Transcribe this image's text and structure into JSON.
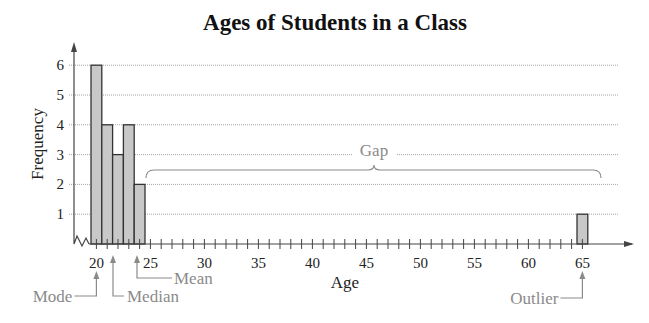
{
  "chart_data": {
    "type": "bar",
    "subtype": "histogram",
    "title": "Ages of Students in a Class",
    "xlabel": "Age",
    "ylabel": "Frequency",
    "categories": [
      20,
      21,
      22,
      23,
      24,
      65
    ],
    "values": [
      6,
      4,
      3,
      4,
      2,
      1
    ],
    "xlim": [
      19,
      66
    ],
    "ylim": [
      0,
      6
    ],
    "x_tick_labels": [
      "20",
      "25",
      "30",
      "35",
      "40",
      "45",
      "50",
      "55",
      "60",
      "65"
    ],
    "y_tick_labels": [
      "1",
      "2",
      "3",
      "4",
      "5",
      "6"
    ],
    "grid": "horizontal",
    "legend": null,
    "annotations": [
      {
        "label": "Mode",
        "x": 20
      },
      {
        "label": "Median",
        "x": 21.5
      },
      {
        "label": "Mean",
        "x": 23.75
      },
      {
        "label": "Gap",
        "x_range": [
          25,
          64
        ]
      },
      {
        "label": "Outlier",
        "x": 65
      }
    ],
    "colors": {
      "bar_fill": "#c8c8c8",
      "bar_stroke": "#333333",
      "grid": "#9a9a9a",
      "annotation": "#8a8a8a"
    }
  }
}
